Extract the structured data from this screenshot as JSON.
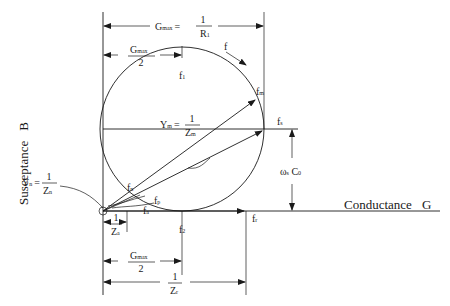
{
  "diagram": {
    "axes": {
      "x_label": "Conductance",
      "x_symbol": "G",
      "y_label": "Susceptance",
      "y_symbol": "B"
    },
    "dimensions": {
      "gmax": {
        "lhs": "G",
        "lhs_sub": "max",
        "eq": "=",
        "num": "1",
        "den": "R",
        "den_sub": "1"
      },
      "gmax_half_top": {
        "num": "G",
        "num_sub": "max",
        "den": "2"
      },
      "gmax_half_bottom": {
        "num": "G",
        "num_sub": "max",
        "den": "2"
      },
      "inv_za": {
        "num": "1",
        "den": "Z",
        "den_sub": "a"
      },
      "inv_zr": {
        "num": "1",
        "den": "Z",
        "den_sub": "r"
      },
      "omega_c0": {
        "text": "ω",
        "sub": "s",
        "tail": " C",
        "tail_sub": "0"
      }
    },
    "vectors": {
      "ym": {
        "lhs": "Y",
        "lhs_sub": "m",
        "eq": "=",
        "num": "1",
        "den": "Z",
        "den_sub": "m"
      },
      "yn": {
        "lhs": "Y",
        "lhs_sub": "n",
        "eq": "=",
        "num": "1",
        "den": "Z",
        "den_sub": "n"
      }
    },
    "frequency_labels": [
      {
        "id": "f",
        "text": "f",
        "sub": ""
      },
      {
        "id": "f1",
        "text": "f",
        "sub": "1"
      },
      {
        "id": "f2",
        "text": "f",
        "sub": "2"
      },
      {
        "id": "fm",
        "text": "f",
        "sub": "m"
      },
      {
        "id": "fn",
        "text": "f",
        "sub": "n"
      },
      {
        "id": "fs",
        "text": "f",
        "sub": "s"
      },
      {
        "id": "fp",
        "text": "f",
        "sub": "p"
      },
      {
        "id": "fa",
        "text": "f",
        "sub": "a"
      },
      {
        "id": "fr",
        "text": "f",
        "sub": "r"
      }
    ]
  }
}
